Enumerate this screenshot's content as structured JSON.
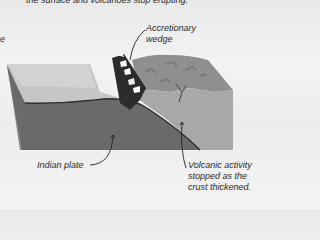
{
  "caption_top": "the surface and volcanoes stop erupting.",
  "caption_left_fragment": "e",
  "labels": {
    "accretionary": [
      "Accretionary",
      "wedge"
    ],
    "indian_plate": "Indian plate",
    "volcanic": [
      "Volcanic activity",
      "stopped as the",
      "crust thickened."
    ]
  },
  "colors": {
    "plate_top": "#c9c9c9",
    "plate_side": "#6e6e6e",
    "crust_top": "#8e8e8e",
    "crust_side": "#a9a9a9",
    "wedge": "#2c2c2c"
  }
}
